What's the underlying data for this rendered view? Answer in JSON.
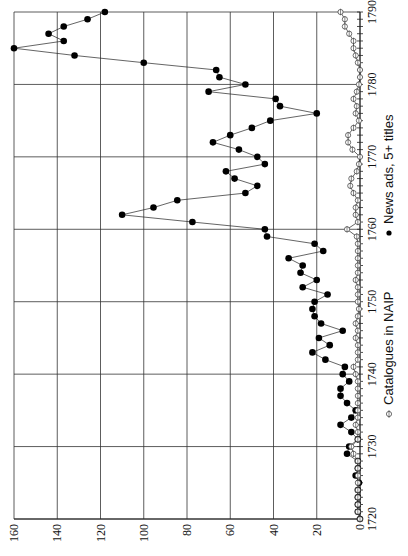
{
  "chart_data": {
    "type": "line",
    "orientation": "rotated-90-ccw",
    "title": "",
    "xlabel": "",
    "ylabel": "",
    "x": [
      1720,
      1721,
      1722,
      1723,
      1724,
      1725,
      1726,
      1727,
      1728,
      1729,
      1730,
      1731,
      1732,
      1733,
      1734,
      1735,
      1736,
      1737,
      1738,
      1739,
      1740,
      1741,
      1742,
      1743,
      1744,
      1745,
      1746,
      1747,
      1748,
      1749,
      1750,
      1751,
      1752,
      1753,
      1754,
      1755,
      1756,
      1757,
      1758,
      1759,
      1760,
      1761,
      1762,
      1763,
      1764,
      1765,
      1766,
      1767,
      1768,
      1769,
      1770,
      1771,
      1772,
      1773,
      1774,
      1775,
      1776,
      1777,
      1778,
      1779,
      1780,
      1781,
      1782,
      1783,
      1784,
      1785,
      1786,
      1787,
      1788,
      1789,
      1790
    ],
    "xlim": [
      1720,
      1790
    ],
    "ylim": [
      0,
      160
    ],
    "x_ticks": [
      "1720",
      "1730",
      "1740",
      "1750",
      "1760",
      "1770",
      "1780",
      "1790"
    ],
    "y_ticks": [
      "0",
      "20",
      "40",
      "60",
      "80",
      "100",
      "120",
      "140",
      "160"
    ],
    "grid": true,
    "series": [
      {
        "name": "News ads, 5+ titles",
        "marker": "filled-circle",
        "values": [
          0,
          1,
          1,
          1,
          1,
          0.5,
          2,
          1,
          1,
          6,
          5,
          1,
          4,
          9,
          4,
          2,
          6,
          9,
          9,
          5,
          8,
          7,
          16,
          22,
          14,
          19,
          8,
          18,
          21,
          22,
          21,
          15,
          26.5,
          20,
          27.5,
          26.5,
          33,
          17,
          21,
          43,
          44,
          77.5,
          110,
          95.5,
          84.5,
          53,
          47.5,
          58,
          62,
          44,
          47.5,
          56,
          68,
          60,
          50,
          41.5,
          20,
          37,
          39,
          70,
          53,
          65,
          66.5,
          100,
          132,
          160,
          137,
          144,
          137,
          126,
          118
        ]
      },
      {
        "name": "Catalogues in NAIP",
        "marker": "open-circle-with-bar",
        "values": [
          0,
          1,
          1,
          1,
          1,
          1,
          1,
          1,
          1,
          3,
          4,
          1,
          1,
          2,
          1,
          1,
          1,
          1,
          1,
          1,
          2,
          3,
          1,
          1,
          1,
          2,
          1,
          2,
          1,
          0.5,
          1,
          1,
          1,
          2,
          1,
          1,
          1,
          1,
          1,
          1.5,
          6,
          1,
          2,
          2,
          1,
          3,
          4.5,
          4,
          1.5,
          0.5,
          0,
          3.5,
          5.5,
          5.5,
          3,
          0.5,
          2,
          1.5,
          3,
          1.5,
          0.5,
          0,
          0,
          1,
          2,
          3,
          3,
          5,
          7,
          7,
          9
        ]
      }
    ],
    "legend": {
      "position": "bottom (rotated)",
      "entries": [
        {
          "label": "Catalogues in NAIP",
          "symbol": "open-circle-with-bar"
        },
        {
          "label": "News ads, 5+ titles",
          "symbol": "filled-circle"
        }
      ]
    }
  }
}
